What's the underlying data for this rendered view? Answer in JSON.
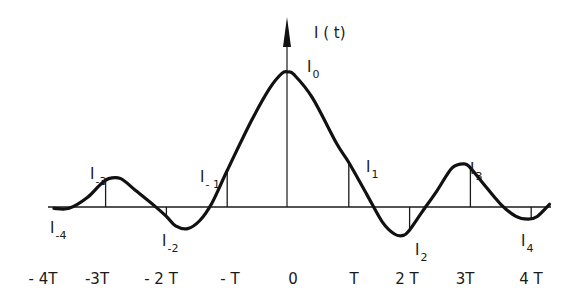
{
  "chart_data": {
    "type": "line",
    "title": "",
    "ylabel": "I(t)",
    "xlabel": "",
    "x_unit": "T",
    "ylim": [
      -0.3,
      1.2
    ],
    "xlim": [
      -4.1,
      4.3
    ],
    "grid": false,
    "legend": "none",
    "x_ticks": [
      {
        "t": -4,
        "label": "- 4T"
      },
      {
        "t": -3,
        "label": "-3T"
      },
      {
        "t": -2,
        "label": "- 2 T"
      },
      {
        "t": -1,
        "label": "- T"
      },
      {
        "t": 0,
        "label": "0"
      },
      {
        "t": 1,
        "label": "T"
      },
      {
        "t": 2,
        "label": "2 T"
      },
      {
        "t": 3,
        "label": "3T"
      },
      {
        "t": 4,
        "label": "4 T"
      }
    ],
    "samples": [
      {
        "t": -4,
        "value": -0.01,
        "label": "I",
        "sub": "-4"
      },
      {
        "t": -3,
        "value": 0.19,
        "label": "I",
        "sub": "-3"
      },
      {
        "t": -2,
        "value": -0.07,
        "label": "I",
        "sub": "-2"
      },
      {
        "t": -1,
        "value": 0.27,
        "label": "I",
        "sub": "- 1"
      },
      {
        "t": 0,
        "value": 1.0,
        "label": "I",
        "sub": "0"
      },
      {
        "t": 1,
        "value": 0.33,
        "label": "I",
        "sub": "1"
      },
      {
        "t": 2,
        "value": -0.17,
        "label": "I",
        "sub": "2"
      },
      {
        "t": 3,
        "value": 0.29,
        "label": "I",
        "sub": "3"
      },
      {
        "t": 4,
        "value": -0.09,
        "label": "I",
        "sub": "4"
      }
    ],
    "curve": {
      "name": "I(t)",
      "x": [
        -3.85,
        -3.6,
        -3.3,
        -3.1,
        -2.95,
        -2.75,
        -2.5,
        -2.2,
        -2.0,
        -1.85,
        -1.65,
        -1.45,
        -1.25,
        -1.0,
        -0.6,
        -0.3,
        -0.1,
        0.0,
        0.1,
        0.4,
        0.8,
        1.0,
        1.3,
        1.55,
        1.75,
        1.9,
        2.0,
        2.2,
        2.45,
        2.7,
        2.9,
        3.0,
        3.2,
        3.5,
        3.75,
        3.95,
        4.1,
        4.3
      ],
      "y": [
        -0.01,
        -0.01,
        0.07,
        0.16,
        0.21,
        0.21,
        0.12,
        0.01,
        -0.07,
        -0.14,
        -0.16,
        -0.1,
        0.03,
        0.27,
        0.64,
        0.88,
        0.99,
        1.0,
        0.98,
        0.81,
        0.47,
        0.33,
        0.09,
        -0.11,
        -0.2,
        -0.21,
        -0.17,
        -0.04,
        0.12,
        0.29,
        0.32,
        0.29,
        0.18,
        0.02,
        -0.07,
        -0.09,
        -0.07,
        0.02
      ]
    }
  },
  "axis": {
    "y_label": "I ( t)"
  }
}
